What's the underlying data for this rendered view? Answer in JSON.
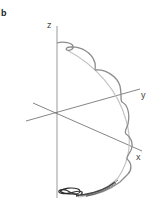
{
  "figure": {
    "panel_label": "b",
    "axes": {
      "z_label": "z",
      "y_label": "y",
      "x_label": "x"
    },
    "colors": {
      "axis": "#666666",
      "z_axis": "#aaaaaa",
      "curve_light": "#b8b8b8",
      "curve_mid": "#8c8c8c",
      "curve_dark": "#3a3a3a"
    }
  }
}
